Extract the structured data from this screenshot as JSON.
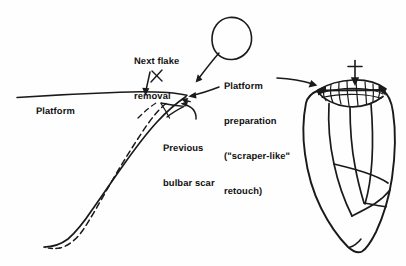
{
  "figure": {
    "background_color": "#fefefe",
    "ink_color": "#1a1a1a"
  },
  "labels": {
    "platform": {
      "name": "platform",
      "lines": [
        "Platform"
      ]
    },
    "next_flake_removal": {
      "name": "next-flake-removal",
      "lines": [
        "Next flake",
        "removal"
      ]
    },
    "platform_preparation": {
      "name": "platform-preparation",
      "lines": [
        "Platform",
        "preparation",
        "(\"scraper-like\"",
        "retouch)"
      ]
    },
    "previous_bulbar_scar": {
      "name": "previous-bulbar-scar",
      "lines": [
        "Previous",
        "bulbar scar"
      ]
    }
  },
  "drawing_elements": [
    {
      "name": "platform-surface-line",
      "type": "line",
      "description": "long near-horizontal platform edge sloping slightly down to the right"
    },
    {
      "name": "core-face-solid-curve",
      "type": "curve",
      "description": "solid curved core face descending to lower left"
    },
    {
      "name": "previous-bulbar-scar-dashed-curve",
      "type": "dashed-curve",
      "description": "dashed curve marking previous bulbar scar"
    },
    {
      "name": "next-flake-x-mark",
      "type": "x-mark",
      "description": "small x marking next flake removal point"
    },
    {
      "name": "next-flake-arrow",
      "type": "arrow",
      "description": "short arrow pointing down to platform at x-mark"
    },
    {
      "name": "detached-flake-oval",
      "type": "oval",
      "description": "egg-shaped outline of the detached flake"
    },
    {
      "name": "flake-leader-arrow",
      "type": "arrow",
      "description": "arrow from detached flake oval down-left to platform edge"
    },
    {
      "name": "platform-edge-arrow",
      "type": "arrow",
      "description": "arrow pointing left into the platform edge"
    },
    {
      "name": "previous-scar-curved-arrow",
      "type": "curved-arrow",
      "description": "curved arrow from Previous bulbar scar label to the scar"
    },
    {
      "name": "platform-preparation-arrow",
      "type": "arrow",
      "description": "horizontal arrow from platform preparation text to core retouch zone"
    },
    {
      "name": "hammer-blow-arrow",
      "type": "arrow-with-crossbar",
      "description": "vertical downward arrow with crossbar indicating blow direction"
    },
    {
      "name": "core-outline",
      "type": "outline",
      "description": "teardrop-shaped stone core seen from the side"
    },
    {
      "name": "core-retouch-zone",
      "type": "facet-cluster",
      "description": "scalloped cluster of small scraper-like retouch facets along the core platform edge"
    },
    {
      "name": "core-flake-scar-ridges",
      "type": "ridges",
      "description": "vertical arris ridges dividing previous flake scars on the core body"
    }
  ]
}
